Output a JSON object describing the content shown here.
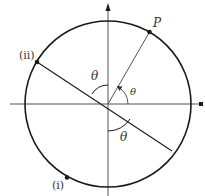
{
  "diagram": {
    "colors": {
      "stroke": "#1a1a1a",
      "axis": "#444444",
      "text": "#333333",
      "background": "#ffffff"
    },
    "center": {
      "x": 108,
      "y": 104
    },
    "radius": 83,
    "labels": {
      "point_p": "P",
      "point_ii": "(ii)",
      "point_i": "(i)",
      "theta_upper_left": "θ",
      "theta_first_quadrant": "θ",
      "theta_lower": "θ"
    },
    "points": [
      {
        "name": "P",
        "x": 149,
        "y": 31
      },
      {
        "name": "(ii)",
        "x": 37,
        "y": 62
      },
      {
        "name": "(i)",
        "x": 67,
        "y": 178
      }
    ]
  }
}
